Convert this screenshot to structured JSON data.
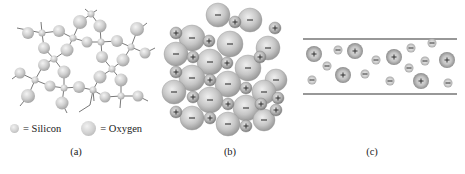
{
  "figure": {
    "panels": [
      {
        "id": "a",
        "caption": "(a)",
        "description": "Amorphous silica network: small silicon atoms bonded to larger oxygen atoms",
        "legend": [
          {
            "symbol": "small-gray-sphere",
            "label": "= Silicon"
          },
          {
            "symbol": "large-gray-sphere",
            "label": "= Oxygen"
          }
        ]
      },
      {
        "id": "b",
        "caption": "(b)",
        "description": "Ionic crystal lattice: small positive ions (+) packed between large negative ions (−)",
        "ion_symbols": {
          "positive": "+",
          "negative": "−"
        }
      },
      {
        "id": "c",
        "caption": "(c)",
        "description": "Ions dispersed between two parallel horizontal lines",
        "ion_symbols": {
          "positive": "+",
          "negative": "−"
        },
        "positive_ion_count": 7,
        "negative_ion_count": 13
      }
    ],
    "colors": {
      "sphere_light": "#f2f2f2",
      "sphere_mid": "#cfcfcf",
      "sphere_dark": "#a9a9a9",
      "line": "#333333",
      "text": "#222222"
    }
  }
}
